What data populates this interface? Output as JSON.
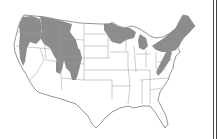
{
  "map": {
    "subject": "Contiguous United States",
    "legend": [],
    "shaded_regions": [
      "Cascades / Pacific Northwest",
      "Northern Rockies (Idaho, western Montana)",
      "Central Rockies (Wyoming, Colorado)",
      "Northern Minnesota / Wisconsin",
      "Michigan",
      "New England / New York / Pennsylvania",
      "Appalachians"
    ],
    "colors": {
      "background": "#ffffff",
      "shaded": "#8c8c8c",
      "state_lines": "#9a9a9a",
      "outline": "#7a7a7a",
      "frame": "#444444"
    }
  }
}
